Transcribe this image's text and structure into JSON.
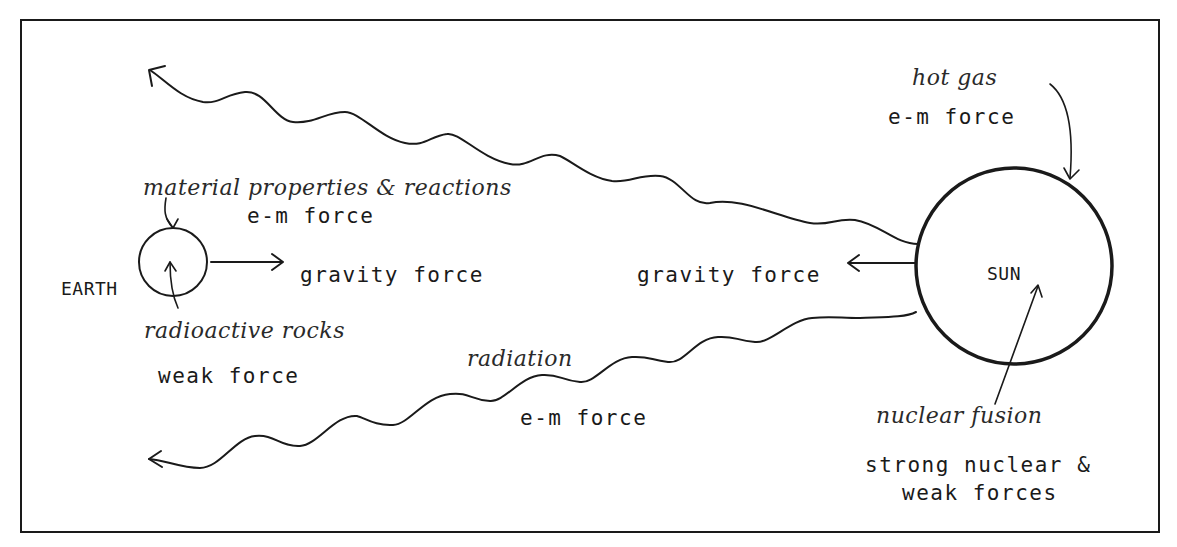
{
  "diagram": {
    "type": "Sun-Earth forces illustration",
    "bodies": {
      "earth": {
        "label": "EARTH"
      },
      "sun": {
        "label": "SUN"
      }
    },
    "labels": {
      "earth_material": "material properties & reactions",
      "earth_material_force": "e-m force",
      "earth_gravity": "gravity force",
      "earth_radioactive": "radioactive rocks",
      "earth_radioactive_force": "weak force",
      "sun_hot_gas": "hot gas",
      "sun_hot_gas_force": "e-m force",
      "sun_gravity": "gravity force",
      "radiation": "radiation",
      "radiation_force": "e-m force",
      "sun_fusion": "nuclear fusion",
      "sun_fusion_force_line1": "strong nuclear &",
      "sun_fusion_force_line2": "weak forces"
    },
    "arrows": [
      {
        "name": "earth-gravity-arrow",
        "from": "earth",
        "direction": "right"
      },
      {
        "name": "sun-gravity-arrow",
        "from": "sun",
        "direction": "left"
      },
      {
        "name": "upper-radiation-wave",
        "from": "sun",
        "direction": "upper-left"
      },
      {
        "name": "lower-radiation-wave",
        "from": "sun",
        "direction": "lower-left"
      },
      {
        "name": "material-pointer-arrow",
        "target": "earth-surface"
      },
      {
        "name": "radioactive-pointer-arrow",
        "target": "earth-interior"
      },
      {
        "name": "hot-gas-pointer-arrow",
        "target": "sun-surface"
      },
      {
        "name": "fusion-pointer-arrow",
        "target": "sun-core"
      }
    ],
    "colors": {
      "ink": "#1a1a1a",
      "background": "#ffffff"
    }
  }
}
